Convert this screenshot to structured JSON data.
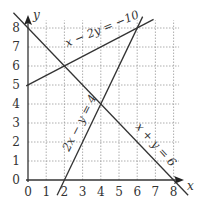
{
  "chart_data": {
    "type": "line",
    "title": "",
    "xlabel": "x",
    "ylabel": "y",
    "xlim": [
      0,
      8
    ],
    "ylim": [
      0,
      8
    ],
    "x_ticks": [
      "0",
      "1",
      "2",
      "3",
      "4",
      "5",
      "6",
      "7",
      "8"
    ],
    "y_ticks": [
      "0",
      "1",
      "2",
      "3",
      "4",
      "5",
      "6",
      "7",
      "8"
    ],
    "grid": true,
    "series": [
      {
        "name": "x − 2y = −10",
        "points": [
          [
            0,
            5
          ],
          [
            6,
            8
          ]
        ]
      },
      {
        "name": "x + y = 6",
        "points": [
          [
            0,
            8
          ],
          [
            8,
            0
          ]
        ]
      },
      {
        "name": "2x − y = 4",
        "points": [
          [
            2,
            0
          ],
          [
            6,
            8
          ]
        ]
      }
    ],
    "annotations": [
      "x − 2y = −10",
      "2x − y = 4",
      "x + y = 6"
    ]
  },
  "labels": {
    "x_axis": "x",
    "y_axis": "y",
    "eq1": "x − 2y = −10",
    "eq2": "2x − y = 4",
    "eq3": "x + y = 6"
  }
}
